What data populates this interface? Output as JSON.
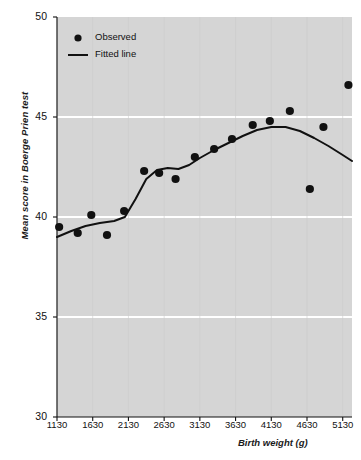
{
  "chart_data": {
    "type": "scatter",
    "title": "",
    "xlabel": "Birth weight (g)",
    "ylabel": "Mean score in Boerge Prien test",
    "xlim": [
      1130,
      5260
    ],
    "ylim": [
      30,
      50
    ],
    "xticks": [
      1130,
      1630,
      2130,
      2630,
      3130,
      3630,
      4130,
      4630,
      5130
    ],
    "yticks": [
      30,
      35,
      40,
      45,
      50
    ],
    "grid": "horizontal-white",
    "legend_position": "top-left",
    "series": [
      {
        "name": "Observed",
        "type": "scatter",
        "marker": "filled-circle",
        "color": "#111111",
        "points": [
          {
            "x": 1160,
            "y": 39.5
          },
          {
            "x": 1420,
            "y": 39.2
          },
          {
            "x": 1610,
            "y": 40.1
          },
          {
            "x": 1830,
            "y": 39.1
          },
          {
            "x": 2070,
            "y": 40.3
          },
          {
            "x": 2350,
            "y": 42.3
          },
          {
            "x": 2560,
            "y": 42.2
          },
          {
            "x": 2790,
            "y": 41.9
          },
          {
            "x": 3060,
            "y": 43.0
          },
          {
            "x": 3330,
            "y": 43.4
          },
          {
            "x": 3580,
            "y": 43.9
          },
          {
            "x": 3870,
            "y": 44.6
          },
          {
            "x": 4110,
            "y": 44.8
          },
          {
            "x": 4390,
            "y": 45.3
          },
          {
            "x": 4670,
            "y": 41.4
          },
          {
            "x": 4860,
            "y": 44.5
          },
          {
            "x": 5210,
            "y": 46.6
          }
        ]
      },
      {
        "name": "Fitted line",
        "type": "line",
        "color": "#111111",
        "points": [
          {
            "x": 1130,
            "y": 39.0
          },
          {
            "x": 1330,
            "y": 39.3
          },
          {
            "x": 1530,
            "y": 39.55
          },
          {
            "x": 1730,
            "y": 39.7
          },
          {
            "x": 1930,
            "y": 39.8
          },
          {
            "x": 2080,
            "y": 40.0
          },
          {
            "x": 2230,
            "y": 40.9
          },
          {
            "x": 2380,
            "y": 41.9
          },
          {
            "x": 2530,
            "y": 42.35
          },
          {
            "x": 2680,
            "y": 42.45
          },
          {
            "x": 2830,
            "y": 42.4
          },
          {
            "x": 2980,
            "y": 42.6
          },
          {
            "x": 3130,
            "y": 42.95
          },
          {
            "x": 3330,
            "y": 43.35
          },
          {
            "x": 3530,
            "y": 43.7
          },
          {
            "x": 3730,
            "y": 44.05
          },
          {
            "x": 3930,
            "y": 44.35
          },
          {
            "x": 4130,
            "y": 44.5
          },
          {
            "x": 4330,
            "y": 44.5
          },
          {
            "x": 4530,
            "y": 44.3
          },
          {
            "x": 4730,
            "y": 43.95
          },
          {
            "x": 4930,
            "y": 43.55
          },
          {
            "x": 5130,
            "y": 43.1
          },
          {
            "x": 5260,
            "y": 42.8
          }
        ]
      }
    ]
  },
  "legend": {
    "items": [
      {
        "label": "Observed",
        "marker": "dot"
      },
      {
        "label": "Fitted line",
        "marker": "line"
      }
    ]
  },
  "style": {
    "plot_background": "#d5d5d5",
    "gridline_color": "#ffffff",
    "ink_color": "#111111",
    "page_background": "#ffffff"
  }
}
